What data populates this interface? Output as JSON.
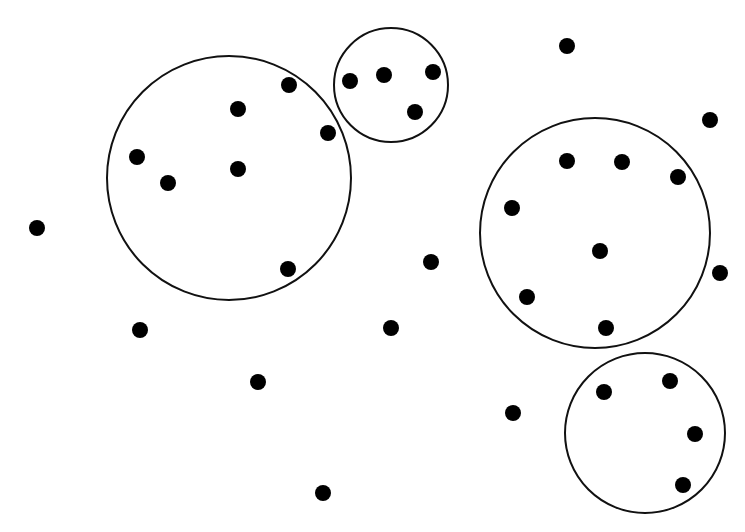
{
  "diagram": {
    "width": 745,
    "height": 532,
    "background": "#ffffff",
    "stroke_color": "#111111",
    "dot_color": "#000000",
    "dot_radius": 8,
    "clusters": [
      {
        "cx": 229,
        "cy": 178,
        "r": 122,
        "points": [
          [
            289,
            85
          ],
          [
            238,
            109
          ],
          [
            328,
            133
          ],
          [
            137,
            157
          ],
          [
            168,
            183
          ],
          [
            238,
            169
          ],
          [
            288,
            269
          ]
        ]
      },
      {
        "cx": 391,
        "cy": 85,
        "r": 57,
        "points": [
          [
            350,
            81
          ],
          [
            384,
            75
          ],
          [
            433,
            72
          ],
          [
            415,
            112
          ]
        ]
      },
      {
        "cx": 595,
        "cy": 233,
        "r": 115,
        "points": [
          [
            567,
            161
          ],
          [
            622,
            162
          ],
          [
            678,
            177
          ],
          [
            512,
            208
          ],
          [
            600,
            251
          ],
          [
            527,
            297
          ],
          [
            606,
            328
          ]
        ]
      },
      {
        "cx": 645,
        "cy": 433,
        "r": 80,
        "points": [
          [
            604,
            392
          ],
          [
            670,
            381
          ],
          [
            695,
            434
          ],
          [
            683,
            485
          ]
        ]
      }
    ],
    "outliers": [
      [
        567,
        46
      ],
      [
        710,
        120
      ],
      [
        37,
        228
      ],
      [
        431,
        262
      ],
      [
        720,
        273
      ],
      [
        140,
        330
      ],
      [
        391,
        328
      ],
      [
        258,
        382
      ],
      [
        513,
        413
      ],
      [
        323,
        493
      ]
    ]
  }
}
